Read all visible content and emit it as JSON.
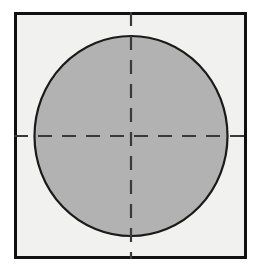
{
  "figure": {
    "canvas": {
      "width": 256,
      "height": 270,
      "background_color": "#ffffff"
    },
    "square": {
      "name": "outer-square",
      "x": 15.5,
      "y": 13.5,
      "width": 230,
      "height": 244,
      "fill_color": "#f1f1ef",
      "stroke_color": "#111111",
      "stroke_width": 2.6
    },
    "circle": {
      "name": "shaded-circle",
      "center_x": 131,
      "center_y": 136,
      "radius_x": 96.5,
      "radius_y": 100,
      "fill_color": "#b2b2b2",
      "stroke_color": "#1a1a1a",
      "stroke_width": 2.2
    },
    "centerlines": {
      "stroke_color": "#3a3a3a",
      "stroke_width": 2.2,
      "dash_length": 14,
      "gap_length": 10,
      "horizontal": {
        "name": "horizontal-centerline",
        "y": 136,
        "x_start": 14,
        "x_end": 247
      },
      "vertical": {
        "name": "vertical-centerline",
        "x": 131,
        "y_start": 12,
        "y_end": 259
      }
    }
  }
}
